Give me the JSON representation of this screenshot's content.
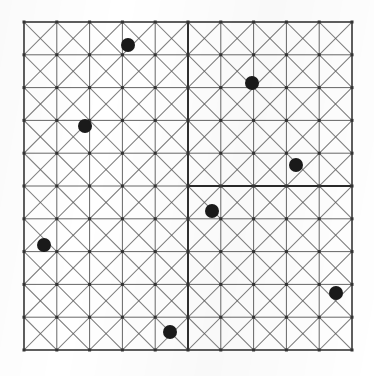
{
  "figure": {
    "type": "lattice-point-diagram",
    "background_color": "#ffffff",
    "line_color": "#5a5a5a",
    "heavy_line_color": "#2a2a2a",
    "border_color": "#4a4a4a",
    "point_color": "#1a1a1a"
  },
  "chart_data": {
    "type": "scatter",
    "xlabel": "",
    "ylabel": "",
    "grid": true,
    "legend": null,
    "xlim": [
      0,
      10
    ],
    "ylim": [
      0,
      10
    ],
    "grid_cols": 10,
    "grid_rows": 10,
    "cell_px": 32.8,
    "origin_px": [
      24,
      22
    ],
    "diagonals": "both",
    "axis_lines": {
      "vertical_x": 5,
      "horizontal_y": 5
    },
    "point_radius_px": 7,
    "points": [
      {
        "label": "p1",
        "x": 3.17,
        "y": 0.7,
        "px": 128,
        "py": 45
      },
      {
        "label": "p2",
        "x": 6.95,
        "y": 1.86,
        "px": 252,
        "py": 83
      },
      {
        "label": "p3",
        "x": 1.86,
        "y": 3.17,
        "px": 85,
        "py": 126
      },
      {
        "label": "p4",
        "x": 8.29,
        "y": 4.36,
        "px": 296,
        "py": 165
      },
      {
        "label": "p5",
        "x": 5.73,
        "y": 5.76,
        "px": 212,
        "py": 211
      },
      {
        "label": "p6",
        "x": 0.61,
        "y": 6.8,
        "px": 44,
        "py": 245
      },
      {
        "label": "p7",
        "x": 9.51,
        "y": 8.26,
        "px": 336,
        "py": 293
      },
      {
        "label": "p8",
        "x": 4.45,
        "y": 9.45,
        "px": 170,
        "py": 332
      }
    ]
  }
}
